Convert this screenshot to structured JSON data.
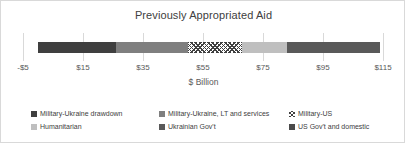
{
  "chart_data": {
    "type": "bar",
    "orientation": "horizontal-stacked",
    "title": "Previously Appropriated Aid",
    "xlabel": "$ Billion",
    "ylabel": "",
    "xlim": [
      -5,
      115
    ],
    "xticks": [
      -5,
      15,
      35,
      55,
      75,
      95,
      115
    ],
    "xticklabels": [
      "-$5",
      "$15",
      "$35",
      "$55",
      "$75",
      "$95",
      "$115"
    ],
    "grid": false,
    "legend_position": "bottom",
    "categories": [
      "Previously Appropriated Aid"
    ],
    "total": 114,
    "series": [
      {
        "name": "Military-Ukraine drawdown",
        "values": [
          26
        ],
        "start": 0,
        "end": 26,
        "color": "#3f3f3f",
        "pattern": "solid"
      },
      {
        "name": "Military-Ukraine, LT and services",
        "values": [
          24
        ],
        "start": 26,
        "end": 50,
        "color": "#7f7f7f",
        "pattern": "solid"
      },
      {
        "name": "Military-US",
        "values": [
          18
        ],
        "start": 50,
        "end": 68,
        "color": "#ffffff",
        "pattern": "hatch"
      },
      {
        "name": "Humanitarian",
        "values": [
          15
        ],
        "start": 68,
        "end": 83,
        "color": "#bfbfbf",
        "pattern": "solid"
      },
      {
        "name": "Ukrainian Gov't",
        "values": [
          31
        ],
        "start": 83,
        "end": 114,
        "color": "#595959",
        "pattern": "solid"
      },
      {
        "name": "US Gov't and domestic",
        "values": [
          0
        ],
        "start": 114,
        "end": 114,
        "color": "#4a4a4a",
        "pattern": "solid"
      }
    ]
  },
  "legend": {
    "rows": [
      [
        {
          "label": "Military-Ukraine drawdown",
          "color": "#3f3f3f",
          "pattern": "solid",
          "left": 0
        },
        {
          "label": "Military-Ukraine, LT and services",
          "color": "#7f7f7f",
          "pattern": "solid",
          "left": 128
        },
        {
          "label": "Military-US",
          "color": "#ffffff",
          "pattern": "hatch",
          "left": 258
        }
      ],
      [
        {
          "label": "Humanitarian",
          "color": "#bfbfbf",
          "pattern": "solid",
          "left": 0
        },
        {
          "label": "Ukrainian Gov't",
          "color": "#595959",
          "pattern": "solid",
          "left": 128
        },
        {
          "label": "US Gov't and domestic",
          "color": "#4a4a4a",
          "pattern": "solid",
          "left": 258
        }
      ]
    ]
  },
  "axis": {
    "tick_positions_px": [
      22,
      82,
      142,
      202,
      262,
      322,
      382
    ],
    "title": "$ Billion"
  },
  "colors": {
    "frame_border": "#d9d9d9",
    "tick": "#d9d9d9",
    "text": "#404040",
    "axis_text": "#595959",
    "background": "#ffffff"
  }
}
